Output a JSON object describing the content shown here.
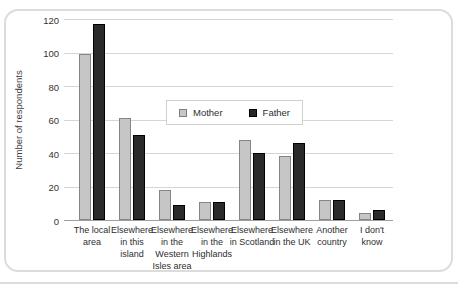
{
  "chart_data": {
    "type": "bar",
    "title": "",
    "xlabel": "",
    "ylabel": "Number of respondents",
    "ylim": [
      0,
      120
    ],
    "yticks": [
      0,
      20,
      40,
      60,
      80,
      100,
      120
    ],
    "grid": true,
    "legend_position": "inside-upper-middle",
    "categories": [
      "The local area",
      "Elsewhere in this island",
      "Elsewhere in the Western Isles area",
      "Elsewhere in the Highlands",
      "Elsewhere in Scotland",
      "Elsewhere in the UK",
      "Another country",
      "I don't know"
    ],
    "series": [
      {
        "name": "Mother",
        "color": "#c6c6c6",
        "border_color": "#858585",
        "values": [
          99,
          61,
          18,
          11,
          48,
          38,
          12,
          4
        ]
      },
      {
        "name": "Father",
        "color": "#2a2a2a",
        "border_color": "#000000",
        "values": [
          117,
          51,
          9,
          11,
          40,
          46,
          12,
          6
        ]
      }
    ]
  },
  "colors": {
    "gridline": "#d6d6d6",
    "axis_line": "#9e9e9e",
    "text": "#333333",
    "frame_border": "#dcdcdc",
    "background": "#ffffff"
  }
}
